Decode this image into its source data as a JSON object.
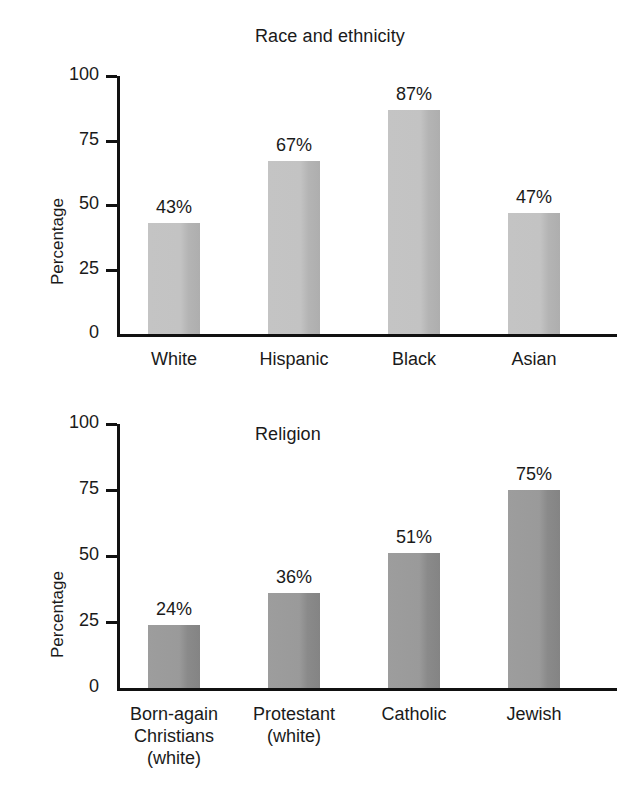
{
  "chart_data": [
    {
      "type": "bar",
      "title": "Race and ethnicity",
      "xlabel": "",
      "ylabel": "Percentage",
      "categories": [
        "White",
        "Hispanic",
        "Black",
        "Asian"
      ],
      "values": [
        43,
        67,
        87,
        47
      ],
      "value_labels": [
        "43%",
        "67%",
        "87%",
        "47%"
      ],
      "ylim": [
        0,
        100
      ],
      "yticks": [
        0,
        25,
        50,
        75,
        100
      ],
      "ytick_labels": [
        "0",
        "25",
        "50",
        "75",
        "100"
      ],
      "grid": false,
      "legend": "none",
      "bar_color": "#c3c3c3",
      "bar_shade_color": "#aeaeae",
      "axis_color": "#111111"
    },
    {
      "type": "bar",
      "title": "Religion",
      "xlabel": "",
      "ylabel": "Percentage",
      "categories": [
        "Born-again\nChristians\n(white)",
        "Protestant\n(white)",
        "Catholic",
        "Jewish"
      ],
      "values": [
        24,
        36,
        51,
        75
      ],
      "value_labels": [
        "24%",
        "36%",
        "51%",
        "75%"
      ],
      "ylim": [
        0,
        100
      ],
      "yticks": [
        0,
        25,
        50,
        75,
        100
      ],
      "ytick_labels": [
        "0",
        "25",
        "50",
        "75",
        "100"
      ],
      "grid": false,
      "legend": "none",
      "bar_color": "#9a9a9a",
      "bar_shade_color": "#848484",
      "axis_color": "#111111"
    }
  ]
}
